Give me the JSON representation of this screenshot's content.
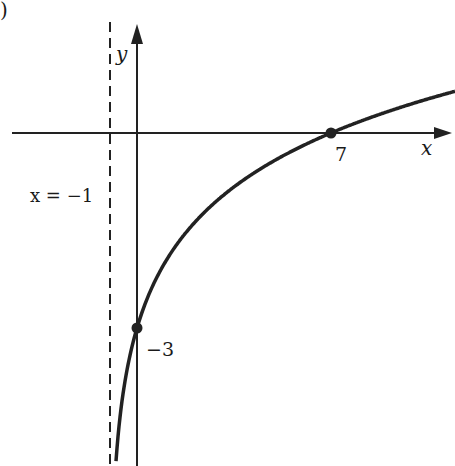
{
  "chart_data": {
    "type": "line",
    "title": "",
    "xlabel": "x",
    "ylabel": "y",
    "function": "y = log2(x + 1) - 3",
    "asymptote": {
      "label": "x = −1",
      "x": -1,
      "style": "dashed"
    },
    "points": [
      {
        "x": 7,
        "y": 0,
        "label": "7"
      },
      {
        "x": 0,
        "y": -3,
        "label": "−3"
      }
    ],
    "series": [
      {
        "name": "curve",
        "x": [
          -0.95,
          -0.9,
          -0.75,
          -0.5,
          0,
          1,
          3,
          7,
          11
        ],
        "y": [
          -7.32,
          -6.32,
          -5.0,
          -4.0,
          -3.0,
          -2.0,
          -1.0,
          0.0,
          0.585
        ]
      }
    ],
    "grid": false
  },
  "labels": {
    "corner": ")",
    "y_axis": "y",
    "x_axis": "x",
    "asymptote": "x = −1",
    "x_intercept": "7",
    "y_intercept": "−3"
  }
}
